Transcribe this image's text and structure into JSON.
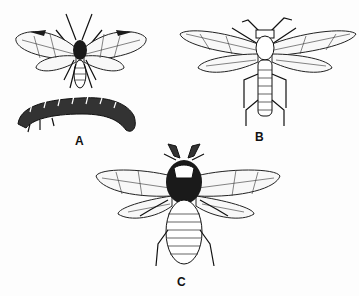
{
  "figure": {
    "panels": [
      {
        "id": "A",
        "label": "A",
        "subject": "adult sawfly with larva (caterpillar-like)"
      },
      {
        "id": "B",
        "label": "B",
        "subject": "adult sawfly, elongated body"
      },
      {
        "id": "C",
        "label": "C",
        "subject": "adult sawfly, broad body with clubbed antennae"
      }
    ]
  }
}
